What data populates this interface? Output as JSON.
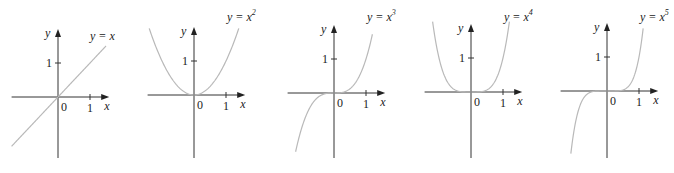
{
  "chart_data": [
    {
      "type": "line",
      "title": "y = x",
      "label": {
        "prefix": "y = x",
        "exponent": ""
      },
      "exponent": 1,
      "xlabel": "x",
      "ylabel": "y",
      "xticks": [
        "0",
        "1"
      ],
      "yticks": [
        "1"
      ],
      "xlim": [
        -1.45,
        1.6
      ],
      "ylim": [
        -1.9,
        2.0
      ],
      "curve_x_range": [
        -1.45,
        1.5
      ],
      "grid": false,
      "curve_color": "#b9b9b9"
    },
    {
      "type": "line",
      "title": "y = x^2",
      "label": {
        "prefix": "y = x",
        "exponent": "2"
      },
      "exponent": 2,
      "xlabel": "x",
      "ylabel": "y",
      "xticks": [
        "0",
        "1"
      ],
      "yticks": [
        "1"
      ],
      "xlim": [
        -1.45,
        1.6
      ],
      "ylim": [
        -1.9,
        2.0
      ],
      "curve_x_range": [
        -1.4,
        1.4
      ],
      "grid": false,
      "curve_color": "#b9b9b9"
    },
    {
      "type": "line",
      "title": "y = x^3",
      "label": {
        "prefix": "y = x",
        "exponent": "3"
      },
      "exponent": 3,
      "xlabel": "x",
      "ylabel": "y",
      "xticks": [
        "0",
        "1"
      ],
      "yticks": [
        "1"
      ],
      "xlim": [
        -1.45,
        1.6
      ],
      "ylim": [
        -1.9,
        2.0
      ],
      "curve_x_range": [
        -1.2,
        1.2
      ],
      "grid": false,
      "curve_color": "#b9b9b9"
    },
    {
      "type": "line",
      "title": "y = x^4",
      "label": {
        "prefix": "y = x",
        "exponent": "4"
      },
      "exponent": 4,
      "xlabel": "x",
      "ylabel": "y",
      "xticks": [
        "0",
        "1"
      ],
      "yticks": [
        "1"
      ],
      "xlim": [
        -1.45,
        1.6
      ],
      "ylim": [
        -1.9,
        2.0
      ],
      "curve_x_range": [
        -1.22,
        1.22
      ],
      "grid": false,
      "curve_color": "#b9b9b9"
    },
    {
      "type": "line",
      "title": "y = x^5",
      "label": {
        "prefix": "y = x",
        "exponent": "5"
      },
      "exponent": 5,
      "xlabel": "x",
      "ylabel": "y",
      "xticks": [
        "0",
        "1"
      ],
      "yticks": [
        "1"
      ],
      "xlim": [
        -1.45,
        1.6
      ],
      "ylim": [
        -1.9,
        2.0
      ],
      "curve_x_range": [
        -1.13,
        1.13
      ],
      "grid": false,
      "curve_color": "#b9b9b9"
    }
  ]
}
